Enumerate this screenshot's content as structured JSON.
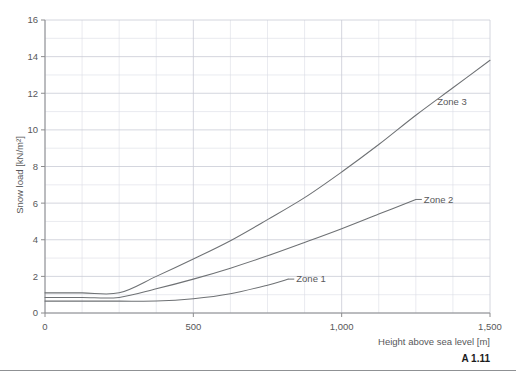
{
  "figure": {
    "number": "A 1.11"
  },
  "chart_data": {
    "type": "line",
    "title": "",
    "xlabel": "Height above sea level [m]",
    "ylabel": "Snow load [kN/m²]",
    "xlim": [
      0,
      1500
    ],
    "ylim": [
      0,
      16
    ],
    "xticks": [
      0,
      500,
      1000,
      1500
    ],
    "xtick_labels": [
      "0",
      "500",
      "1,000",
      "1,500"
    ],
    "yticks": [
      0,
      2,
      4,
      6,
      8,
      10,
      12,
      14,
      16
    ],
    "ytick_labels": [
      "0",
      "2",
      "4",
      "6",
      "8",
      "10",
      "12",
      "14",
      "16"
    ],
    "x_minor_step": 125,
    "y_minor_step": 1,
    "grid": true,
    "legend_position": "inline-annotations",
    "series": [
      {
        "name": "Zone 1",
        "label": "Zone 1",
        "x": [
          0,
          125,
          250,
          375,
          500,
          625,
          750,
          820
        ],
        "y": [
          0.65,
          0.65,
          0.65,
          0.65,
          0.78,
          1.05,
          1.52,
          1.85
        ],
        "label_anchor_x": 820,
        "label_anchor_y": 1.85
      },
      {
        "name": "Zone 2",
        "label": "Zone 2",
        "x": [
          0,
          125,
          250,
          375,
          500,
          625,
          750,
          875,
          1000,
          1125,
          1250
        ],
        "y": [
          0.85,
          0.85,
          0.85,
          1.32,
          1.85,
          2.45,
          3.12,
          3.85,
          4.6,
          5.4,
          6.2
        ],
        "label_anchor_x": 1250,
        "label_anchor_y": 6.2
      },
      {
        "name": "Zone 3",
        "label": "Zone 3",
        "x": [
          0,
          125,
          250,
          375,
          500,
          625,
          750,
          875,
          1000,
          1125,
          1250,
          1375,
          1500
        ],
        "y": [
          1.1,
          1.1,
          1.1,
          2.0,
          2.95,
          3.95,
          5.1,
          6.3,
          7.7,
          9.2,
          10.8,
          12.3,
          13.8
        ],
        "label_anchor_x": 1450,
        "label_anchor_y": 11.4
      }
    ]
  },
  "colors": {
    "curve": "#6e7174",
    "grid_major": "#c9ccd6",
    "grid_minor": "#dcdee5",
    "axis": "#8c8c8e",
    "text": "#58585a"
  }
}
